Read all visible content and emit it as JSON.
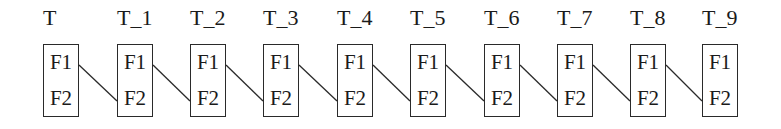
{
  "diagram": {
    "nodes": [
      {
        "label": "T",
        "fields": [
          "F1",
          "F2"
        ],
        "x": 43
      },
      {
        "label": "T_1",
        "fields": [
          "F1",
          "F2"
        ],
        "x": 117
      },
      {
        "label": "T_2",
        "fields": [
          "F1",
          "F2"
        ],
        "x": 190
      },
      {
        "label": "T_3",
        "fields": [
          "F1",
          "F2"
        ],
        "x": 263
      },
      {
        "label": "T_4",
        "fields": [
          "F1",
          "F2"
        ],
        "x": 337
      },
      {
        "label": "T_5",
        "fields": [
          "F1",
          "F2"
        ],
        "x": 410
      },
      {
        "label": "T_6",
        "fields": [
          "F1",
          "F2"
        ],
        "x": 484
      },
      {
        "label": "T_7",
        "fields": [
          "F1",
          "F2"
        ],
        "x": 557
      },
      {
        "label": "T_8",
        "fields": [
          "F1",
          "F2"
        ],
        "x": 630
      },
      {
        "label": "T_9",
        "fields": [
          "F1",
          "F2"
        ],
        "x": 702
      }
    ],
    "edges": [
      {
        "from": "T.F1",
        "to": "T_1.F2"
      },
      {
        "from": "T_1.F1",
        "to": "T_2.F2"
      },
      {
        "from": "T_2.F1",
        "to": "T_3.F2"
      },
      {
        "from": "T_3.F1",
        "to": "T_4.F2"
      },
      {
        "from": "T_4.F1",
        "to": "T_5.F2"
      },
      {
        "from": "T_5.F1",
        "to": "T_6.F2"
      },
      {
        "from": "T_6.F1",
        "to": "T_7.F2"
      },
      {
        "from": "T_7.F1",
        "to": "T_8.F2"
      },
      {
        "from": "T_8.F1",
        "to": "T_9.F2"
      }
    ],
    "colors": {
      "stroke": "#2a2a2a",
      "text": "#1a1a1a",
      "background": "#ffffff"
    }
  }
}
